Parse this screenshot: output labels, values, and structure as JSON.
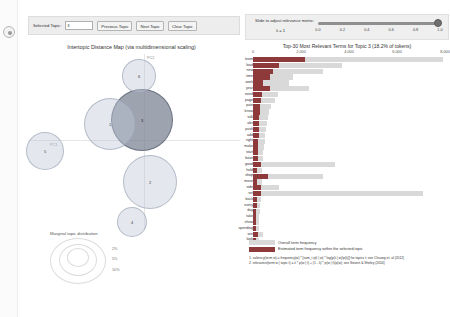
{
  "toolbar": {
    "selected_topic_label": "Selected Topic:",
    "selected_topic_value": "3",
    "previous_topic_label": "Previous Topic",
    "next_topic_label": "Next Topic",
    "clear_topic_label": "Clear Topic"
  },
  "slider": {
    "title": "Slide to adjust relevance metric:",
    "lambda_label": "λ = 1",
    "value": 1,
    "ticks": [
      "0.0",
      "0.2",
      "0.4",
      "0.6",
      "0.8",
      "1.0"
    ]
  },
  "map": {
    "title": "Intertopic Distance Map (via multidimensional scaling)",
    "x_axis_label": "PC1",
    "y_axis_label": "PC2",
    "legend_title": "Marginal topic distribution",
    "legend_sizes": [
      "2%",
      "5%",
      "10%"
    ],
    "topics": [
      {
        "id": "5",
        "x": 17,
        "y": 97,
        "r": 19,
        "selected": false
      },
      {
        "id": "3",
        "x": 114,
        "y": 66,
        "r": 31,
        "selected": true
      },
      {
        "id": "1",
        "x": 82,
        "y": 70,
        "r": 26,
        "selected": false
      },
      {
        "id": "6",
        "x": 111,
        "y": 22,
        "r": 17,
        "selected": false
      },
      {
        "id": "2",
        "x": 122,
        "y": 128,
        "r": 27,
        "selected": false
      },
      {
        "id": "4",
        "x": 104,
        "y": 168,
        "r": 15,
        "selected": false
      }
    ]
  },
  "legend": {
    "overall_label": "Overall term frequency",
    "topic_label": "Estimated term frequency within the selected topic"
  },
  "footnotes": [
    "1. saliency(term w) = frequency(w) * [sum_t p(t | w) * log(p(t | w)/p(t))] for topics t; see Chuang et. al (2012)",
    "2. relevance(term w | topic t) = λ * p(w | t) + (1 - λ) * p(w | t)/p(w); see Sievert & Shirley (2014)"
  ],
  "chart_data": {
    "type": "bar",
    "orientation": "horizontal",
    "title": "Top-30 Most Relevant Terms for Topic 3 (18.2% of tokens)",
    "xlabel": "",
    "ylabel": "",
    "xlim": [
      0,
      8000
    ],
    "xticks": [
      0,
      2000,
      4000,
      6000,
      8000
    ],
    "xtick_labels": [
      "0",
      "2,000",
      "4,000",
      "6,000",
      "8,000"
    ],
    "grid": false,
    "legend_position": "bottom-left",
    "categories": [
      "team",
      "load",
      "new",
      "time",
      "work",
      "year",
      "need",
      "page",
      "pain",
      "know",
      "talk",
      "abs",
      "push",
      "add",
      "right",
      "make",
      "start",
      "base",
      "good",
      "hold",
      "shop",
      "move",
      "side",
      "set",
      "back",
      "every",
      "day",
      "take",
      "show",
      "spending",
      "win",
      "look"
    ],
    "series": [
      {
        "name": "Overall term frequency",
        "values": [
          7900,
          3700,
          2900,
          1650,
          1500,
          2350,
          1050,
          900,
          770,
          680,
          640,
          600,
          560,
          520,
          500,
          470,
          430,
          400,
          3400,
          390,
          2900,
          370,
          1100,
          7100,
          330,
          300,
          280,
          260,
          250,
          240,
          420,
          230
        ]
      },
      {
        "name": "Estimated term frequency within the selected topic",
        "values": [
          2150,
          1080,
          820,
          700,
          420,
          700,
          390,
          330,
          300,
          290,
          270,
          260,
          250,
          235,
          225,
          215,
          205,
          195,
          330,
          185,
          620,
          175,
          330,
          340,
          160,
          150,
          145,
          140,
          135,
          130,
          200,
          125
        ]
      }
    ]
  }
}
